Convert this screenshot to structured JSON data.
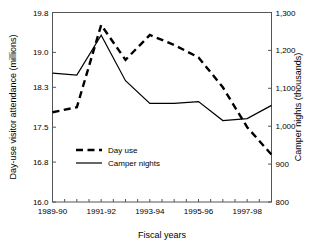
{
  "chart_data": {
    "type": "line",
    "title": "",
    "xlabel": "Fiscal years",
    "ylabel": "Day-use visitor attendance (millions)",
    "y2label": "Camper nights (thousands)",
    "grid": false,
    "legend_position": "inside-lower-left",
    "x": [
      "1989-90",
      "1990-91",
      "1991-92",
      "1992-93",
      "1993-94",
      "1994-95",
      "1995-96",
      "1996-97",
      "1997-98",
      "1998-99"
    ],
    "xtick_labels": [
      "1989-90",
      "1991-92",
      "1993-94",
      "1995-96",
      "1997-98"
    ],
    "xtick_positions": [
      0,
      2,
      4,
      6,
      8
    ],
    "ylim": [
      16.0,
      19.8
    ],
    "ytick_labels": [
      "16.0",
      "16.8",
      "17.5",
      "18.3",
      "19.0",
      "19.8"
    ],
    "ytick_values": [
      16.0,
      16.8,
      17.5,
      18.3,
      19.0,
      19.8
    ],
    "y2lim": [
      800,
      1300
    ],
    "y2tick_labels": [
      "800",
      "900",
      "1,000",
      "1,100",
      "1,200",
      "1,300"
    ],
    "y2tick_values": [
      800,
      900,
      1000,
      1100,
      1200,
      1300
    ],
    "series": [
      {
        "name": "Day use",
        "axis": "left",
        "style": "dashed",
        "units": "millions",
        "values": [
          17.8,
          17.9,
          19.55,
          18.85,
          19.35,
          19.15,
          18.9,
          18.3,
          17.5,
          16.95
        ]
      },
      {
        "name": "Camper nights",
        "axis": "right",
        "style": "solid",
        "units": "thousands",
        "values": [
          1140,
          1135,
          1240,
          1120,
          1060,
          1060,
          1065,
          1015,
          1020,
          1055
        ]
      }
    ],
    "legend": [
      {
        "label": "Day use",
        "style": "dashed"
      },
      {
        "label": "Camper nights",
        "style": "solid"
      }
    ],
    "colors": {
      "series": "#000000",
      "axis": "#555555",
      "background": "#ffffff"
    }
  }
}
